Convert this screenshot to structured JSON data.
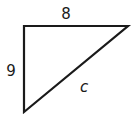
{
  "diagram": {
    "type": "right-triangle",
    "labels": {
      "top_side": "8",
      "left_side": "9",
      "hypotenuse": "c"
    },
    "colors": {
      "stroke": "#1a1a1a",
      "background": "#ffffff"
    }
  }
}
